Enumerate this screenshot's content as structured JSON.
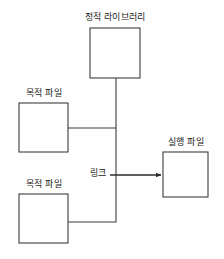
{
  "diagram": {
    "background_color": "#fefefe",
    "stroke_color": "#3c3c3c",
    "box_fill_color": "#ffffff",
    "text_color": "#1a1a1a",
    "nodes": [
      {
        "id": "static-library",
        "label": "정적 라이브러리",
        "x": 90,
        "y": 28,
        "width": 50,
        "height": 50
      },
      {
        "id": "object-file-1",
        "label": "목적 파일",
        "x": 19,
        "y": 103,
        "width": 49,
        "height": 49
      },
      {
        "id": "object-file-2",
        "label": "목적 파일",
        "x": 19,
        "y": 194,
        "width": 49,
        "height": 49
      },
      {
        "id": "executable",
        "label": "실행 파일",
        "x": 163,
        "y": 152,
        "width": 45,
        "height": 45
      }
    ],
    "edges": [
      {
        "id": "static-library-to-junction",
        "from": "static-library",
        "to": "link-junction",
        "arrow": false
      },
      {
        "id": "object-file-1-to-junction",
        "from": "object-file-1",
        "to": "link-junction",
        "arrow": false
      },
      {
        "id": "object-file-2-to-junction",
        "from": "object-file-2",
        "to": "link-junction",
        "arrow": false
      },
      {
        "id": "junction-to-executable",
        "from": "link-junction",
        "to": "executable",
        "arrow": true
      }
    ],
    "edge_labels": [
      {
        "id": "link",
        "label": "링크",
        "x": 88,
        "y": 168
      }
    ]
  }
}
